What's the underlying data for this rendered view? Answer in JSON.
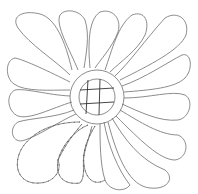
{
  "diagram": {
    "title": "",
    "colors": {
      "line": "#6e6e6e",
      "background": "#ffffff"
    },
    "elements": [
      "feather-lobes",
      "center-ring",
      "crosshatch-grid",
      "stitch-marks"
    ]
  }
}
